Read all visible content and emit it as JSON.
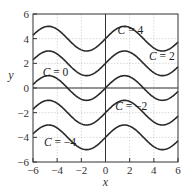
{
  "chart_data": {
    "type": "line",
    "title": "",
    "xlabel": "x",
    "ylabel": "y",
    "xlim": [
      -6,
      6
    ],
    "ylim": [
      -6,
      6
    ],
    "xticks": [
      -6,
      -4,
      -2,
      0,
      2,
      4,
      6
    ],
    "yticks": [
      -6,
      -4,
      -2,
      0,
      2,
      4,
      6
    ],
    "xtick_labels": [
      "−6",
      "−4",
      "−2",
      "0",
      "2",
      "4",
      "6"
    ],
    "ytick_labels": [
      "−6",
      "−4",
      "−2",
      "0",
      "2",
      "4",
      "6"
    ],
    "grid": true,
    "function": "y = sin(x) + C",
    "series": [
      {
        "name": "C = 4",
        "C": 4,
        "label_pos": [
          1.0,
          4.4
        ]
      },
      {
        "name": "C = 2",
        "C": 2,
        "label_pos": [
          3.6,
          2.3
        ]
      },
      {
        "name": "C = 0",
        "C": 0,
        "label_pos": [
          -5.2,
          1.0
        ]
      },
      {
        "name": "C = −2",
        "C": -2,
        "label_pos": [
          0.8,
          -1.8
        ]
      },
      {
        "name": "C = −4",
        "C": -4,
        "label_pos": [
          -5.1,
          -4.7
        ]
      }
    ],
    "colors": {
      "curve": "#2a2a2a",
      "axis": "#333333",
      "grid": "#c8c8c8"
    }
  },
  "labels": {
    "x_axis": "x",
    "y_axis": "y",
    "c4": "C = 4",
    "c2": "C = 2",
    "c0": "C = 0",
    "cm2": "C = −2",
    "cm4": "C = −4"
  }
}
